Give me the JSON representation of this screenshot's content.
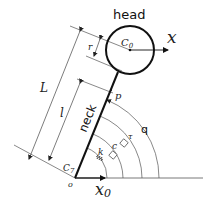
{
  "diagram": {
    "labels": {
      "head": "head",
      "neck": "neck",
      "head_center": "C",
      "head_center_sub": "0",
      "x_axis": "x",
      "x0_axis": "x",
      "x0_axis_sub": "0",
      "vertebra": "C",
      "vertebra_sub": "7",
      "origin": "o",
      "point_p": "p",
      "length_L": "L",
      "length_l": "l",
      "radius_r": "r",
      "angle_q": "q",
      "torque_tau": "τ",
      "damping_c": "c",
      "stiffness_k": "k"
    },
    "colors": {
      "stroke": "#111111",
      "thin_line": "#555555",
      "background": "#ffffff"
    }
  }
}
